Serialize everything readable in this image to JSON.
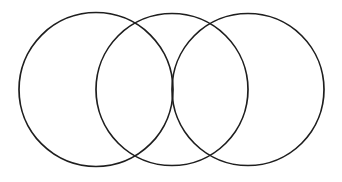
{
  "diagram": {
    "type": "venn",
    "width": 342,
    "height": 182,
    "background": "#ffffff",
    "stroke_color": "#1e1e1e",
    "stroke_width": 1.7,
    "circles": [
      {
        "name": "circle-left",
        "cx": 96,
        "cy": 89.5,
        "r": 77
      },
      {
        "name": "circle-middle",
        "cx": 172,
        "cy": 89.5,
        "r": 76
      },
      {
        "name": "circle-right",
        "cx": 248,
        "cy": 89.5,
        "r": 76
      }
    ],
    "labels": []
  }
}
